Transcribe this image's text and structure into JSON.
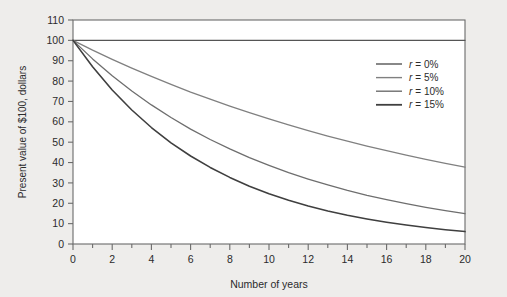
{
  "chart_data": {
    "type": "line",
    "title": "",
    "xlabel": "Number of years",
    "ylabel": "Present value of $100, dollars",
    "xlim": [
      0,
      20
    ],
    "ylim": [
      0,
      110
    ],
    "xticks": [
      0,
      2,
      4,
      6,
      8,
      10,
      12,
      14,
      16,
      18,
      20
    ],
    "xminor_step": 1,
    "yticks": [
      0,
      10,
      20,
      30,
      40,
      50,
      60,
      70,
      80,
      90,
      100,
      110
    ],
    "grid": false,
    "legend_position": "upper right",
    "x": [
      0,
      1,
      2,
      3,
      4,
      5,
      6,
      7,
      8,
      9,
      10,
      11,
      12,
      13,
      14,
      15,
      16,
      17,
      18,
      19,
      20
    ],
    "series": [
      {
        "name": "r = 0%",
        "rate": 0.0,
        "color": "#555555",
        "values": [
          100,
          100,
          100,
          100,
          100,
          100,
          100,
          100,
          100,
          100,
          100,
          100,
          100,
          100,
          100,
          100,
          100,
          100,
          100,
          100,
          100
        ]
      },
      {
        "name": "r = 5%",
        "rate": 0.05,
        "color": "#808080",
        "values": [
          100,
          95.2,
          90.7,
          86.4,
          82.3,
          78.4,
          74.6,
          71.1,
          67.7,
          64.5,
          61.4,
          58.5,
          55.7,
          53.0,
          50.5,
          48.1,
          45.8,
          43.6,
          41.6,
          39.6,
          37.7
        ]
      },
      {
        "name": "r = 10%",
        "rate": 0.1,
        "color": "#6e6e6e",
        "values": [
          100,
          90.9,
          82.6,
          75.1,
          68.3,
          62.1,
          56.4,
          51.3,
          46.7,
          42.4,
          38.6,
          35.0,
          31.9,
          29.0,
          26.3,
          23.9,
          21.8,
          19.8,
          18.0,
          16.4,
          14.9
        ]
      },
      {
        "name": "r = 15%",
        "rate": 0.15,
        "color": "#3f3f3f",
        "values": [
          100,
          87.0,
          75.6,
          65.8,
          57.2,
          49.7,
          43.2,
          37.6,
          32.7,
          28.4,
          24.7,
          21.5,
          18.7,
          16.2,
          14.1,
          12.3,
          10.7,
          9.3,
          8.1,
          7.0,
          6.1
        ]
      }
    ]
  },
  "axes": {
    "y_tick_labels": [
      "0",
      "10",
      "20",
      "30",
      "40",
      "50",
      "60",
      "70",
      "80",
      "90",
      "100",
      "110"
    ],
    "x_tick_labels": [
      "0",
      "2",
      "4",
      "6",
      "8",
      "10",
      "12",
      "14",
      "16",
      "18",
      "20"
    ],
    "x_title": "Number of years",
    "y_title": "Present value of $100, dollars"
  },
  "legend": {
    "items": [
      {
        "symbol": "r",
        "label": "= 0%"
      },
      {
        "symbol": "r",
        "label": "= 5%"
      },
      {
        "symbol": "r",
        "label": "= 10%"
      },
      {
        "symbol": "r",
        "label": "= 15%"
      }
    ]
  },
  "style": {
    "background": "#eeedeb",
    "plot_background": "#ffffff",
    "axis_color": "#6b6b6b",
    "text_color": "#2b2b2b"
  }
}
